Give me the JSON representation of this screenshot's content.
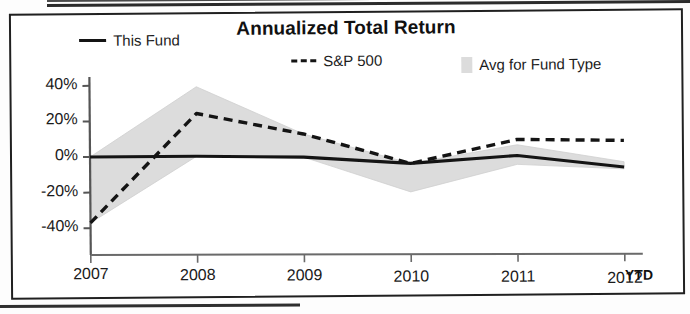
{
  "chart_data": {
    "type": "line",
    "title": "Annualized Total Return",
    "xlabel": "",
    "ylabel": "",
    "x": [
      "2007",
      "2008",
      "2009",
      "2010",
      "2011",
      "2012"
    ],
    "x_suffix_label": "YTD",
    "ylim": [
      -50,
      45
    ],
    "yticks": [
      40,
      20,
      0,
      -20,
      -40
    ],
    "ytick_labels": [
      "40%",
      "20%",
      "0%",
      "-20%",
      "-40%",
      "0%"
    ],
    "grid": false,
    "legend_position": "top",
    "series": [
      {
        "name": "This Fund",
        "style": "solid",
        "color": "#141414",
        "values": [
          0,
          0,
          -1,
          -5,
          -1,
          -8
        ]
      },
      {
        "name": "S&P 500",
        "style": "dashed",
        "color": "#141414",
        "values": [
          -37,
          24,
          12,
          -5,
          8,
          7
        ]
      },
      {
        "name": "Avg for Fund Type",
        "style": "band",
        "color": "#dcdcdc",
        "upper": [
          0,
          39,
          12,
          -5,
          5,
          -5
        ],
        "lower": [
          -37,
          0,
          -1,
          -21,
          -6,
          -9
        ]
      }
    ]
  },
  "chart": {
    "title": "Annualized Total Return",
    "legend": [
      {
        "label": "This Fund",
        "swatch": "solid-line-swatch"
      },
      {
        "label": "S&P 500",
        "swatch": "dashed-line-swatch"
      },
      {
        "label": "Avg for Fund Type",
        "swatch": "shaded-band-swatch"
      }
    ],
    "y_axis": {
      "ticks": [
        "40%",
        "20%",
        "0%",
        "-20%",
        "-40%"
      ]
    },
    "x_axis": {
      "ticks": [
        "2007",
        "2008",
        "2009",
        "2010",
        "2011",
        "2012"
      ],
      "suffix": "YTD"
    }
  }
}
